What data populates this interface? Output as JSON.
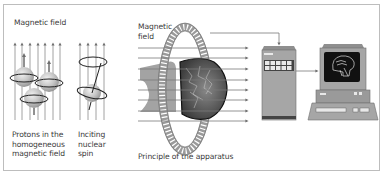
{
  "figure": {
    "panels": [
      {
        "id": "protons",
        "header": "Magnetic field",
        "caption_lines": [
          "Protons in the",
          "homogeneous",
          "magnetic field"
        ]
      },
      {
        "id": "inciting",
        "caption_lines": [
          "Inciting",
          "nuclear",
          "spin"
        ]
      },
      {
        "id": "apparatus",
        "header_lines": [
          "Magnetic",
          "field"
        ],
        "caption": "Principle of the apparatus"
      }
    ],
    "components": [
      "magnetic-coil-ring",
      "patient-head",
      "computing-cabinet",
      "display-workstation"
    ],
    "colors": {
      "border": "#bdbdbd",
      "text": "#3a3a3a",
      "field_line": "#8a8a8a",
      "sphere": "#bdbdbd",
      "device": "#9e9e9e",
      "screen": "#111111"
    }
  }
}
